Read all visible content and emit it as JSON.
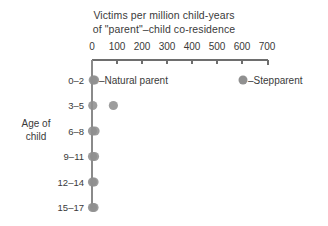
{
  "chart_data": {
    "type": "scatter",
    "title": "Victims per million child-years of \"parent\"–child co-residence",
    "title_lines": [
      "Victims per million child-years",
      "of \"parent\"–child co-residence"
    ],
    "xlabel": "",
    "ylabel": "Age of child",
    "ylabel_lines": [
      "Age of",
      "child"
    ],
    "categories": [
      "0–2",
      "3–5",
      "6–8",
      "9–11",
      "12–14",
      "15–17"
    ],
    "xlim": [
      0,
      700
    ],
    "xticks": [
      0,
      100,
      200,
      300,
      400,
      500,
      600,
      700
    ],
    "xtick_labels": [
      "0",
      "100",
      "200",
      "300",
      "400",
      "500",
      "600",
      "700"
    ],
    "grid": false,
    "legend_position": "inline-annotations",
    "series": [
      {
        "name": "Natural parent",
        "color": "#909090",
        "values": [
          5,
          3,
          2,
          2,
          2,
          2
        ]
      },
      {
        "name": "Stepparent",
        "color": "#909090",
        "values": [
          10,
          85,
          12,
          10,
          8,
          8
        ]
      }
    ],
    "annotations": [
      {
        "name": "natural-parent",
        "text": "–Natural parent",
        "category": "0–2",
        "value": 0
      },
      {
        "name": "stepparent",
        "text": "–Stepparent",
        "category": "0–2",
        "value": 605
      }
    ]
  },
  "colors": {
    "marker": "#909090",
    "axis": "#6e6e6e",
    "text": "#3a3a3a",
    "background": "#ffffff"
  }
}
